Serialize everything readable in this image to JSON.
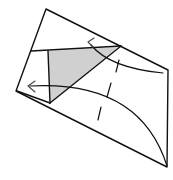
{
  "diagram": {
    "type": "origami-fold-step",
    "colors": {
      "background": "#ffffff",
      "line": "#111111",
      "shade": "#d0d0d0",
      "arrow": "#444444"
    },
    "paper_outline": [
      [
        46,
        9
      ],
      [
        168,
        70
      ],
      [
        167,
        167
      ],
      [
        16,
        91
      ]
    ],
    "shaded_triangle": [
      [
        31,
        51
      ],
      [
        121,
        46
      ],
      [
        50,
        103
      ]
    ],
    "flap_lines": {
      "top_edge": [
        [
          31,
          51
        ],
        [
          121,
          46
        ]
      ],
      "left_vertical": [
        [
          48,
          51
        ],
        [
          50,
          103
        ]
      ],
      "diagonal": [
        [
          121,
          46
        ],
        [
          50,
          103
        ]
      ],
      "lower_left": [
        [
          16,
          91
        ],
        [
          50,
          103
        ]
      ]
    },
    "curves": {
      "upper_arc": "M 90 45 Q 110 68 163 73",
      "lower_arc": "M 30 86 Q 140 80 167 167"
    },
    "arrows": [
      {
        "name": "arrow-upper",
        "tip": [
          88,
          42
        ]
      },
      {
        "name": "arrow-left",
        "tip": [
          28,
          86
        ]
      }
    ],
    "valley_fold_dashes": [
      [
        [
          119,
          60
        ],
        [
          116,
          72
        ]
      ],
      [
        [
          111,
          83
        ],
        [
          107,
          97
        ]
      ],
      [
        [
          101,
          107
        ],
        [
          98,
          120
        ]
      ]
    ],
    "cross_tick": [
      [
        112,
        64
      ],
      [
        124,
        68
      ]
    ]
  }
}
